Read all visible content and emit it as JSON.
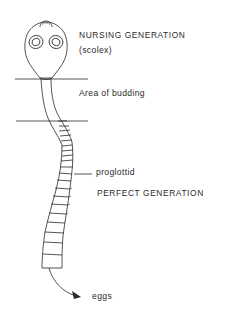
{
  "diagram": {
    "labels": {
      "nursing_generation": "NURSING GENERATION",
      "scolex": "(scolex)",
      "area_of_budding": "Area of budding",
      "proglottid": "proglottid",
      "perfect_generation": "PERFECT GENERATION",
      "eggs": "eggs"
    },
    "colors": {
      "line": "#2a2a2a",
      "background": "#ffffff"
    }
  }
}
